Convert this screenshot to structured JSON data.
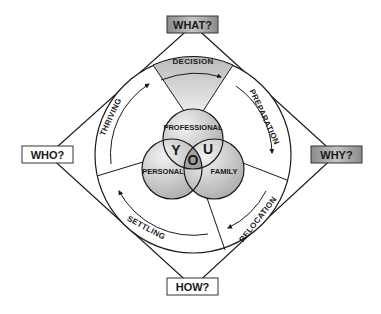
{
  "diagram": {
    "corners": {
      "top": {
        "label": "WHAT?",
        "fill": "#a9a9a9"
      },
      "left": {
        "label": "WHO?",
        "fill": "#ffffff"
      },
      "right": {
        "label": "WHY?",
        "fill": "#9e9e9e"
      },
      "bottom": {
        "label": "HOW?",
        "fill": "#ffffff"
      }
    },
    "cycle_stages": [
      {
        "label": "DECISION",
        "position": "top",
        "highlighted": true
      },
      {
        "label": "PREPARATION",
        "position": "right-upper"
      },
      {
        "label": "RELOCATION",
        "position": "right-lower"
      },
      {
        "label": "SETTLING",
        "position": "bottom-left"
      },
      {
        "label": "THRIVING",
        "position": "left"
      }
    ],
    "venn": {
      "circles": [
        {
          "label": "PROFESSIONAL",
          "position": "top"
        },
        {
          "label": "PERSONAL",
          "position": "bottom-left"
        },
        {
          "label": "FAMILY",
          "position": "bottom-right"
        }
      ],
      "center_letters": [
        "Y",
        "O",
        "U"
      ]
    },
    "colors": {
      "stroke": "#1a1a1a",
      "decision_fill": "#c8c8c8",
      "venn_fill": "#d6d6d6",
      "venn_overlap": "#a8a8a8"
    }
  }
}
